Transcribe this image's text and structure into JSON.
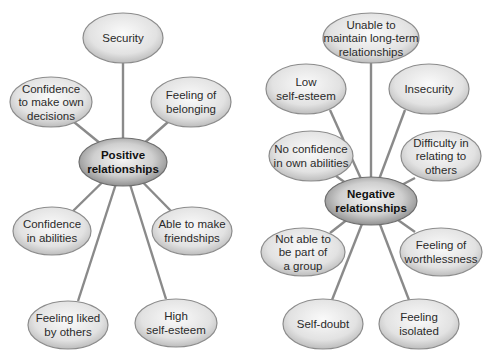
{
  "diagrams": [
    {
      "id": "positive",
      "hub": {
        "lines": [
          "Positive",
          "relationships"
        ],
        "cx": 123,
        "cy": 162,
        "rx": 44,
        "ry": 24
      },
      "nodes": [
        {
          "lines": [
            "Security"
          ],
          "cx": 123,
          "cy": 38,
          "rx": 40,
          "ry": 25
        },
        {
          "lines": [
            "Confidence",
            "to make own",
            "decisions"
          ],
          "cx": 51,
          "cy": 102,
          "rx": 41,
          "ry": 25
        },
        {
          "lines": [
            "Feeling of",
            "belonging"
          ],
          "cx": 191,
          "cy": 102,
          "rx": 40,
          "ry": 25
        },
        {
          "lines": [
            "Confidence",
            "in abilities"
          ],
          "cx": 52,
          "cy": 231,
          "rx": 39,
          "ry": 24
        },
        {
          "lines": [
            "Able to make",
            "friendships"
          ],
          "cx": 192,
          "cy": 231,
          "rx": 40,
          "ry": 24
        },
        {
          "lines": [
            "Feeling liked",
            "by others"
          ],
          "cx": 68,
          "cy": 325,
          "rx": 40,
          "ry": 24
        },
        {
          "lines": [
            "High",
            "self-esteem"
          ],
          "cx": 176,
          "cy": 323,
          "rx": 41,
          "ry": 24
        }
      ],
      "edges_to": [
        [
          123,
          63
        ],
        [
          74,
          122
        ],
        [
          168,
          122
        ],
        [
          72,
          212
        ],
        [
          172,
          212
        ],
        [
          78,
          301
        ],
        [
          166,
          299
        ]
      ]
    },
    {
      "id": "negative",
      "hub": {
        "lines": [
          "Negative",
          "relationships"
        ],
        "cx": 371,
        "cy": 201,
        "rx": 46,
        "ry": 24
      },
      "nodes": [
        {
          "lines": [
            "Unable to",
            "maintain long-term",
            "relationships"
          ],
          "cx": 371,
          "cy": 38,
          "rx": 48,
          "ry": 25
        },
        {
          "lines": [
            "Low",
            "self-esteem"
          ],
          "cx": 306,
          "cy": 89,
          "rx": 40,
          "ry": 25
        },
        {
          "lines": [
            "Insecurity"
          ],
          "cx": 429,
          "cy": 89,
          "rx": 40,
          "ry": 25
        },
        {
          "lines": [
            "No confidence",
            "in own abilities"
          ],
          "cx": 311,
          "cy": 156,
          "rx": 42,
          "ry": 25
        },
        {
          "lines": [
            "Difficulty in",
            "relating to",
            "others"
          ],
          "cx": 441,
          "cy": 156,
          "rx": 40,
          "ry": 25
        },
        {
          "lines": [
            "Not able to",
            "be part of",
            "a group"
          ],
          "cx": 303,
          "cy": 252,
          "rx": 42,
          "ry": 24
        },
        {
          "lines": [
            "Feeling of",
            "worthlessness"
          ],
          "cx": 441,
          "cy": 252,
          "rx": 41,
          "ry": 24
        },
        {
          "lines": [
            "Self-doubt"
          ],
          "cx": 323,
          "cy": 324,
          "rx": 40,
          "ry": 25
        },
        {
          "lines": [
            "Feeling",
            "isolated"
          ],
          "cx": 419,
          "cy": 324,
          "rx": 40,
          "ry": 25
        }
      ],
      "edges_to": [
        [
          371,
          63
        ],
        [
          330,
          110
        ],
        [
          405,
          110
        ],
        [
          336,
          176
        ],
        [
          415,
          178
        ],
        [
          330,
          233
        ],
        [
          415,
          232
        ],
        [
          332,
          300
        ],
        [
          409,
          300
        ]
      ]
    }
  ],
  "colors": {
    "line": "#8a8a8a",
    "node_fill": "#e6e6e6",
    "node_stroke": "#8c8c8c",
    "hub_dark": "#8a8a8a",
    "hub_light": "#f2f2f2",
    "text": "#2a2a2a"
  }
}
